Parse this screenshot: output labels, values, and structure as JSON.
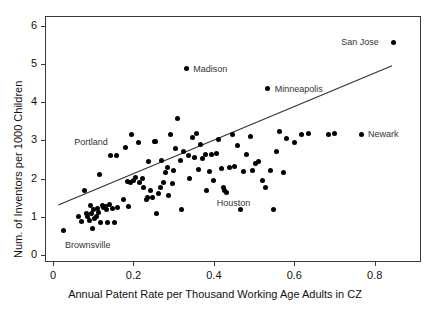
{
  "chart_data": {
    "type": "scatter",
    "title": "",
    "xlabel": "Annual Patent Rate per Thousand Working Age Adults in CZ",
    "ylabel": "Num. of Inventors per 1000 Children",
    "xlim": [
      -0.02,
      0.915
    ],
    "ylim": [
      -0.18,
      6.25
    ],
    "xticks": [
      0,
      0.2,
      0.4,
      0.6,
      0.8
    ],
    "xticklabels": [
      "0",
      "0.2",
      "0.4",
      "0.6",
      "0.8"
    ],
    "yticks": [
      0,
      1,
      2,
      3,
      4,
      5,
      6
    ],
    "yticklabels": [
      "0",
      "1",
      "2",
      "3",
      "4",
      "5",
      "6"
    ],
    "grid": false,
    "legend": false,
    "marker_color": "#000000",
    "marker_size_px": 5,
    "fit_line": {
      "label": "linear fit",
      "x0": 0.013,
      "y0": 1.31,
      "x1": 0.843,
      "y1": 4.95,
      "color": "#333333"
    },
    "annotations": [
      {
        "label": "San Jose",
        "x": 0.846,
        "y": 5.57,
        "text_dx": -52,
        "text_dy": -4
      },
      {
        "label": "Madison",
        "x": 0.331,
        "y": 4.87,
        "text_dx": 7,
        "text_dy": -4
      },
      {
        "label": "Minneapolis",
        "x": 0.534,
        "y": 4.35,
        "text_dx": 7,
        "text_dy": -4
      },
      {
        "label": "Newark",
        "x": 0.766,
        "y": 3.16,
        "text_dx": 7,
        "text_dy": -4
      },
      {
        "label": "Portland",
        "x": 0.142,
        "y": 2.6,
        "text_dx": -36,
        "text_dy": -18
      },
      {
        "label": "Houston",
        "x": 0.427,
        "y": 1.7,
        "text_dx": -8,
        "text_dy": 9
      },
      {
        "label": "Brownsville",
        "x": 0.025,
        "y": 0.64,
        "text_dx": 2,
        "text_dy": 10
      }
    ],
    "points": [
      [
        0.025,
        0.64
      ],
      [
        0.063,
        1.0
      ],
      [
        0.072,
        0.88
      ],
      [
        0.078,
        1.7
      ],
      [
        0.082,
        1.1
      ],
      [
        0.086,
        1.02
      ],
      [
        0.09,
        0.9
      ],
      [
        0.092,
        1.3
      ],
      [
        0.095,
        1.08
      ],
      [
        0.098,
        0.7
      ],
      [
        0.1,
        1.18
      ],
      [
        0.104,
        0.96
      ],
      [
        0.108,
        1.02
      ],
      [
        0.11,
        1.22
      ],
      [
        0.113,
        1.12
      ],
      [
        0.116,
        2.12
      ],
      [
        0.118,
        0.86
      ],
      [
        0.122,
        1.3
      ],
      [
        0.126,
        1.24
      ],
      [
        0.13,
        1.26
      ],
      [
        0.133,
        1.2
      ],
      [
        0.136,
        0.84
      ],
      [
        0.14,
        1.32
      ],
      [
        0.142,
        2.6
      ],
      [
        0.148,
        1.22
      ],
      [
        0.152,
        0.86
      ],
      [
        0.158,
        2.6
      ],
      [
        0.16,
        1.24
      ],
      [
        0.176,
        1.46
      ],
      [
        0.18,
        2.8
      ],
      [
        0.185,
        1.92
      ],
      [
        0.188,
        1.26
      ],
      [
        0.192,
        1.9
      ],
      [
        0.196,
        3.16
      ],
      [
        0.2,
        1.96
      ],
      [
        0.205,
        2.02
      ],
      [
        0.212,
        2.94
      ],
      [
        0.216,
        1.9
      ],
      [
        0.222,
        2.0
      ],
      [
        0.226,
        1.76
      ],
      [
        0.232,
        1.46
      ],
      [
        0.236,
        1.5
      ],
      [
        0.238,
        2.44
      ],
      [
        0.242,
        1.68
      ],
      [
        0.248,
        1.5
      ],
      [
        0.252,
        2.98
      ],
      [
        0.256,
        2.96
      ],
      [
        0.258,
        1.1
      ],
      [
        0.262,
        1.62
      ],
      [
        0.266,
        1.76
      ],
      [
        0.27,
        2.48
      ],
      [
        0.274,
        1.9
      ],
      [
        0.28,
        2.16
      ],
      [
        0.285,
        2.3
      ],
      [
        0.288,
        1.56
      ],
      [
        0.292,
        3.14
      ],
      [
        0.296,
        1.88
      ],
      [
        0.3,
        2.2
      ],
      [
        0.305,
        2.78
      ],
      [
        0.31,
        3.58
      ],
      [
        0.316,
        2.48
      ],
      [
        0.32,
        1.2
      ],
      [
        0.325,
        2.72
      ],
      [
        0.331,
        4.87
      ],
      [
        0.336,
        2.6
      ],
      [
        0.34,
        2.0
      ],
      [
        0.346,
        3.08
      ],
      [
        0.352,
        2.56
      ],
      [
        0.356,
        3.18
      ],
      [
        0.362,
        2.24
      ],
      [
        0.366,
        2.9
      ],
      [
        0.372,
        2.52
      ],
      [
        0.378,
        2.64
      ],
      [
        0.382,
        1.7
      ],
      [
        0.388,
        2.18
      ],
      [
        0.394,
        2.62
      ],
      [
        0.4,
        1.96
      ],
      [
        0.406,
        2.66
      ],
      [
        0.412,
        3.02
      ],
      [
        0.418,
        2.26
      ],
      [
        0.424,
        1.76
      ],
      [
        0.427,
        1.7
      ],
      [
        0.432,
        1.64
      ],
      [
        0.44,
        2.3
      ],
      [
        0.446,
        3.16
      ],
      [
        0.452,
        2.32
      ],
      [
        0.458,
        2.86
      ],
      [
        0.466,
        1.2
      ],
      [
        0.474,
        2.18
      ],
      [
        0.482,
        2.64
      ],
      [
        0.49,
        3.1
      ],
      [
        0.496,
        2.2
      ],
      [
        0.504,
        2.4
      ],
      [
        0.512,
        2.44
      ],
      [
        0.52,
        1.96
      ],
      [
        0.528,
        1.78
      ],
      [
        0.534,
        4.35
      ],
      [
        0.54,
        2.22
      ],
      [
        0.548,
        1.2
      ],
      [
        0.556,
        2.72
      ],
      [
        0.564,
        3.22
      ],
      [
        0.572,
        2.16
      ],
      [
        0.58,
        3.06
      ],
      [
        0.6,
        2.94
      ],
      [
        0.618,
        3.14
      ],
      [
        0.636,
        3.18
      ],
      [
        0.686,
        3.16
      ],
      [
        0.7,
        3.18
      ],
      [
        0.766,
        3.16
      ],
      [
        0.846,
        5.57
      ]
    ]
  },
  "plot_area": {
    "left_px": 45,
    "top_px": 16,
    "width_px": 376,
    "height_px": 246
  }
}
